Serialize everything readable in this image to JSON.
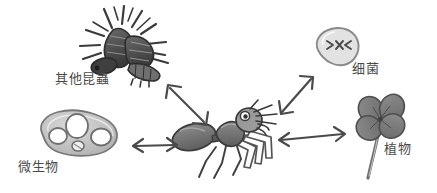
{
  "figure": {
    "type": "ecological-relationship-diagram",
    "background_color": "#ffffff",
    "style": "hand-drawn grayscale sketch",
    "center_subject": "ant"
  },
  "palette": {
    "ink": "#4a4a4a",
    "stroke_dark": "#3d3d3d",
    "fill_dark": "#6e6e6e",
    "fill_mid": "#8c8c8c",
    "fill_light": "#b8b8b8",
    "fill_pale": "#d6d6d6",
    "background": "#ffffff"
  },
  "nodes": [
    {
      "id": "other-insects",
      "label": "其他昆蟲",
      "icon": "insect-cluster-icon",
      "position": "top-left",
      "x": 130,
      "y": 42
    },
    {
      "id": "microorganisms",
      "label": "微生物",
      "icon": "amoeba-blob-icon",
      "position": "left",
      "x": 75,
      "y": 133
    },
    {
      "id": "ant",
      "label": "",
      "icon": "ant-icon",
      "position": "center",
      "x": 228,
      "y": 140
    },
    {
      "id": "bacteria",
      "label": "细菌",
      "icon": "bacteria-cell-icon",
      "position": "top-right",
      "x": 335,
      "y": 52
    },
    {
      "id": "plants",
      "label": "植物",
      "icon": "clover-plant-icon",
      "position": "right",
      "x": 396,
      "y": 128
    }
  ],
  "connections": [
    {
      "id": "ant-other-insects",
      "from": "ant",
      "to": "other-insects",
      "arrow": "double-headed",
      "orientation": "diagonal-up-left"
    },
    {
      "id": "ant-microorganisms",
      "from": "ant",
      "to": "microorganisms",
      "arrow": "double-headed",
      "orientation": "horizontal-left"
    },
    {
      "id": "ant-bacteria",
      "from": "ant",
      "to": "bacteria",
      "arrow": "double-headed",
      "orientation": "diagonal-up-right"
    },
    {
      "id": "ant-plants",
      "from": "ant",
      "to": "plants",
      "arrow": "double-headed",
      "orientation": "horizontal-right"
    }
  ]
}
